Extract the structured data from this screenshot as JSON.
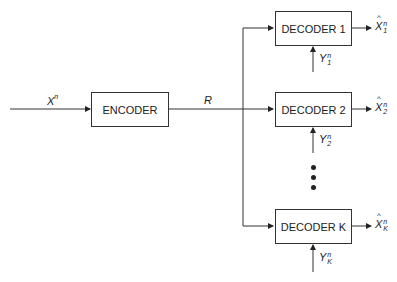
{
  "diagram": {
    "input_label": {
      "base": "X",
      "sup": "n"
    },
    "encoder": {
      "label": "ENCODER"
    },
    "rate_label": "R",
    "decoders": [
      {
        "label": "DECODER 1",
        "side_info": {
          "base": "Y",
          "sup": "n",
          "sub": "1"
        },
        "output": {
          "base": "X",
          "sup": "n",
          "sub": "1"
        }
      },
      {
        "label": "DECODER 2",
        "side_info": {
          "base": "Y",
          "sup": "n",
          "sub": "2"
        },
        "output": {
          "base": "X",
          "sup": "n",
          "sub": "2"
        }
      },
      {
        "label": "DECODER K",
        "side_info": {
          "base": "Y",
          "sup": "n",
          "sub": "K"
        },
        "output": {
          "base": "X",
          "sup": "n",
          "sub": "K"
        }
      }
    ],
    "line_color": "#333333"
  }
}
